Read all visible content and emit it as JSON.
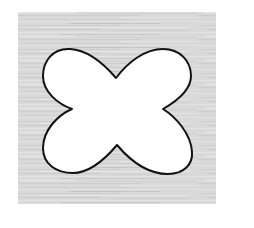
{
  "figure": {
    "background_color": "#ffffff",
    "panel": {
      "x": 18,
      "y": 12,
      "width": 198,
      "height": 192,
      "fill": "#d9d9d9",
      "texture": "horizontal-streaks",
      "streak_colors": [
        "#cfcfcf",
        "#e4e4e4",
        "#c8c8c8",
        "#e8e8e8"
      ]
    },
    "shape": {
      "type": "four-lobed-cross",
      "fill": "#ffffff",
      "stroke": "#111111",
      "stroke_width": 2,
      "notches": {
        "top": [
          116,
          78
        ],
        "left": [
          72,
          109
        ],
        "right": [
          163,
          109
        ],
        "bottom": [
          117,
          145
        ]
      }
    }
  }
}
